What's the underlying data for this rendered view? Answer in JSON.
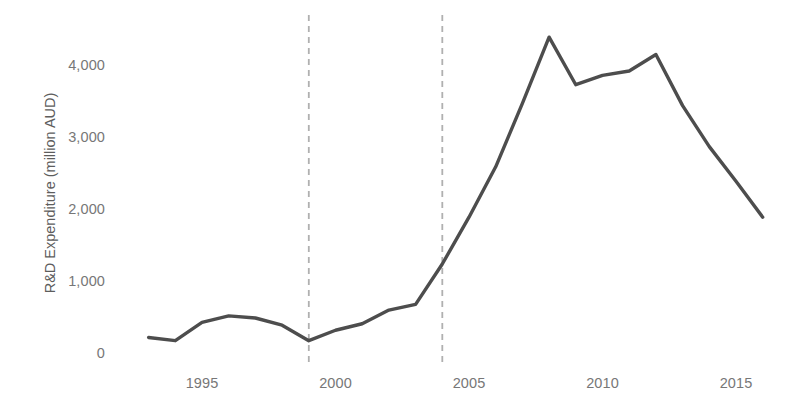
{
  "chart_data": {
    "type": "line",
    "title": "",
    "xlabel": "",
    "ylabel": "R&D Expenditure (million AUD)",
    "xlim": [
      1992.4,
      2016.6
    ],
    "ylim": [
      0,
      4600
    ],
    "grid": false,
    "legend": "none",
    "x_tick_labels": [
      "1995",
      "2000",
      "2005",
      "2010",
      "2015"
    ],
    "x_ticks": [
      1995,
      2000,
      2005,
      2010,
      2015
    ],
    "y_tick_labels": [
      "0",
      "1,000",
      "2,000",
      "3,000",
      "4,000"
    ],
    "y_ticks": [
      0,
      1000,
      2000,
      3000,
      4000
    ],
    "series": [
      {
        "name": "R&D Expenditure",
        "color": "#4d4d4d",
        "x": [
          1993,
          1994,
          1995,
          1996,
          1997,
          1998,
          1999,
          2000,
          2001,
          2002,
          2003,
          2004,
          2005,
          2006,
          2007,
          2008,
          2009,
          2010,
          2011,
          2012,
          2013,
          2014,
          2015,
          2016
        ],
        "values": [
          230,
          185,
          440,
          530,
          500,
          400,
          185,
          330,
          420,
          610,
          690,
          1250,
          1900,
          2600,
          3480,
          4400,
          3740,
          3870,
          3930,
          4160,
          3450,
          2880,
          2400,
          1900
        ]
      }
    ],
    "annotations": [
      {
        "type": "vertical-dashed-line",
        "x": 1999,
        "color": "#b0b0b0",
        "label": ""
      },
      {
        "type": "vertical-dashed-line",
        "x": 2004,
        "color": "#b0b0b0",
        "label": ""
      }
    ]
  },
  "axis": {
    "y_title": "R&D Expenditure (million AUD)"
  }
}
